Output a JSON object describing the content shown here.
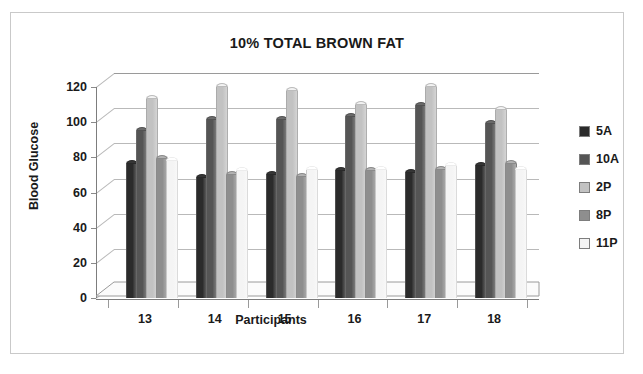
{
  "chart_data": {
    "type": "bar",
    "title": "10% TOTAL BROWN FAT",
    "xlabel": "Participants",
    "ylabel": "Blood Glucose",
    "categories": [
      "13",
      "14",
      "15",
      "16",
      "17",
      "18"
    ],
    "ylim": [
      0,
      120
    ],
    "yticks": [
      0,
      20,
      40,
      60,
      80,
      100,
      120
    ],
    "ytick_labels": [
      "0",
      "20",
      "40",
      "60",
      "80",
      "100",
      "120"
    ],
    "grid": true,
    "legend_position": "right",
    "style": "3d-clustered-column",
    "series": [
      {
        "name": "5A",
        "color": "#2b2b2b",
        "values": [
          76,
          68,
          70,
          72,
          71,
          75
        ]
      },
      {
        "name": "10A",
        "color": "#555555",
        "values": [
          95,
          101,
          101,
          103,
          109,
          99
        ]
      },
      {
        "name": "2P",
        "color": "#c2c2c2",
        "values": [
          113,
          120,
          118,
          110,
          120,
          107
        ]
      },
      {
        "name": "8P",
        "color": "#8e8e8e",
        "values": [
          79,
          70,
          69,
          72,
          73,
          76
        ]
      },
      {
        "name": "11P",
        "color": "#f4f4f4",
        "values": [
          78,
          72,
          73,
          73,
          75,
          73
        ]
      }
    ]
  },
  "legend": {
    "items": [
      {
        "label": "5A",
        "color": "#2b2b2b"
      },
      {
        "label": "10A",
        "color": "#555555"
      },
      {
        "label": "2P",
        "color": "#c2c2c2"
      },
      {
        "label": "8P",
        "color": "#8e8e8e"
      },
      {
        "label": "11P",
        "color": "#f4f4f4"
      }
    ]
  }
}
